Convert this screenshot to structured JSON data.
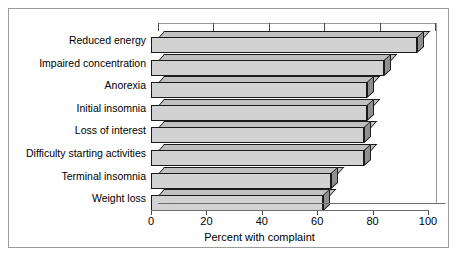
{
  "figure": {
    "frame_color": "#9a9a9a",
    "background": "#ffffff"
  },
  "chart_data": {
    "type": "bar",
    "orientation": "horizontal",
    "style": "3d",
    "title": "",
    "xlabel": "Percent with complaint",
    "ylabel": "",
    "xlim": [
      0,
      100
    ],
    "xticks": [
      0,
      20,
      40,
      60,
      80,
      100
    ],
    "xtick_labels": [
      "0",
      "20",
      "40",
      "60",
      "80",
      "100"
    ],
    "grid": false,
    "legend": null,
    "categories": [
      "Reduced energy",
      "Impaired concentration",
      "Anorexia",
      "Initial insomnia",
      "Loss of interest",
      "Difficulty starting activities",
      "Terminal insomnia",
      "Weight loss"
    ],
    "values": [
      96,
      84,
      78,
      78,
      77,
      77,
      65,
      62
    ],
    "bar_face_color": "#d2d2d2",
    "bar_side_color": "#8f8f8f",
    "bar_top_color": "#c0c0c0",
    "bar_edge_color": "#1a1a1a"
  }
}
